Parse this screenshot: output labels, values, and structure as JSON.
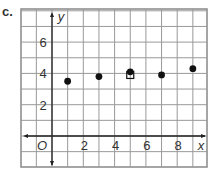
{
  "label": "c.",
  "chart_data": {
    "type": "scatter",
    "title": "",
    "xlabel": "x",
    "ylabel": "y",
    "origin_label": "O",
    "x_ticks": [
      2,
      4,
      6,
      8
    ],
    "y_ticks": [
      2,
      4,
      6
    ],
    "xlim": [
      -2,
      10
    ],
    "ylim": [
      -1,
      8
    ],
    "grid": true,
    "series": [
      {
        "name": "points",
        "marker": "circle",
        "x": [
          1,
          3,
          5,
          7,
          9
        ],
        "y": [
          3.5,
          3.8,
          4.1,
          3.9,
          4.3
        ]
      },
      {
        "name": "mean",
        "marker": "square-open",
        "x": [
          5
        ],
        "y": [
          3.9
        ]
      }
    ]
  }
}
